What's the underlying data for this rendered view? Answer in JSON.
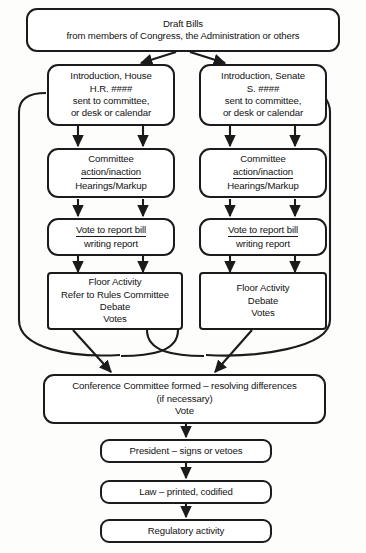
{
  "diagram": {
    "type": "flowchart",
    "stroke_color": "#1b1b1b",
    "fill_color": "#ffffff",
    "background_color": "#fdfdfc"
  },
  "nodes": {
    "draft_bills": {
      "lines": [
        "Draft Bills",
        "from members of Congress, the Administration or others"
      ],
      "line1": "Draft Bills",
      "line2": "from members of Congress, the Administration or others"
    },
    "intro_house": {
      "line1": "Introduction, House",
      "line2": "H.R. ####",
      "line3": "sent to committee,",
      "line4": "or desk or calendar"
    },
    "intro_senate": {
      "line1": "Introduction, Senate",
      "line2": "S. ####",
      "line3": "sent to committee,",
      "line4": "or desk or calendar"
    },
    "committee_house": {
      "line1": "Committee",
      "line2": "action/inaction",
      "line3": "Hearings/Markup"
    },
    "committee_senate": {
      "line1": "Committee",
      "line2": "action/inaction",
      "line3": "Hearings/Markup"
    },
    "vote_report_house": {
      "line1": "Vote to report bill",
      "line2": "writing report"
    },
    "vote_report_senate": {
      "line1": "Vote to report bill",
      "line2": "writing report"
    },
    "floor_house": {
      "line1": "Floor Activity",
      "line2": "Refer to Rules Committee",
      "line3": "Debate",
      "line4": "Votes"
    },
    "floor_senate": {
      "line1": "Floor Activity",
      "line2": "Debate",
      "line3": "Votes"
    },
    "conference": {
      "line1": "Conference Committee formed – resolving differences",
      "line2": "(if necessary)",
      "line3": "Vote"
    },
    "president": {
      "line1": "President – signs or vetoes"
    },
    "law": {
      "line1": "Law – printed, codified"
    },
    "regulatory": {
      "line1": "Regulatory activity"
    }
  }
}
